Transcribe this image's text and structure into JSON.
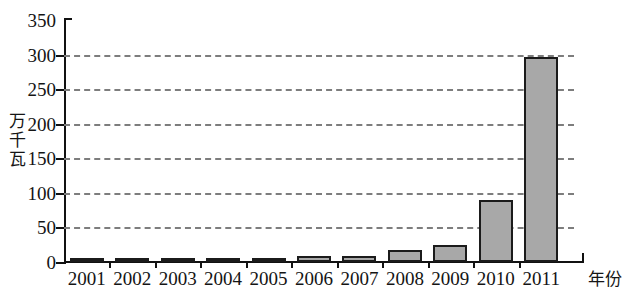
{
  "chart_data": {
    "type": "bar",
    "title": "",
    "subtitle": "",
    "xlabel": "年份",
    "ylabel": "万千瓦",
    "categories": [
      "2001",
      "2002",
      "2003",
      "2004",
      "2005",
      "2006",
      "2007",
      "2008",
      "2009",
      "2010",
      "2011"
    ],
    "values": [
      4,
      4,
      4,
      6,
      6,
      8,
      8,
      18,
      25,
      89,
      297
    ],
    "ylim": [
      0,
      350
    ],
    "ytick_labels": [
      "0",
      "50",
      "100",
      "150",
      "200",
      "250",
      "300",
      "350"
    ],
    "ytick_values": [
      0,
      50,
      100,
      150,
      200,
      250,
      300,
      350
    ],
    "grid": "horizontal-dashed",
    "legend": "none",
    "bar_fill_color": "#a8a8a8",
    "bar_border_color": "#1b1b1b",
    "grid_color": "#7d7d7d",
    "axis_color": "#111111"
  }
}
